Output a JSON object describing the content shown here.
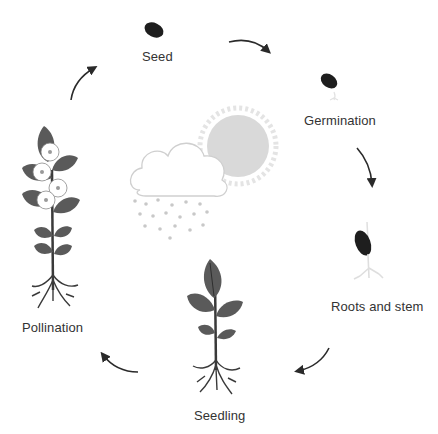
{
  "diagram": {
    "stages": [
      {
        "id": "seed",
        "label": "Seed"
      },
      {
        "id": "germination",
        "label": "Germination"
      },
      {
        "id": "roots-and-stem",
        "label": "Roots and stem"
      },
      {
        "id": "seedling",
        "label": "Seedling"
      },
      {
        "id": "pollination",
        "label": "Pollination"
      }
    ],
    "center": {
      "elements": [
        "cloud",
        "rain",
        "sun"
      ]
    },
    "arrows": [
      {
        "from": "Seed",
        "to": "Germination"
      },
      {
        "from": "Germination",
        "to": "Roots and stem"
      },
      {
        "from": "Roots and stem",
        "to": "Seedling"
      },
      {
        "from": "Seedling",
        "to": "Pollination"
      },
      {
        "from": "Pollination",
        "to": "Seed"
      }
    ],
    "colors": {
      "seed": "#1e1e1e",
      "leaf": "#5a5a5a",
      "leaf_vein": "#2e2e2e",
      "stem": "#3a3a3a",
      "arrow": "#2a2a2a",
      "sun": "#d9d9d9",
      "cloud_outline": "#cfcfcf",
      "rain": "#c8c8c8",
      "text": "#333333"
    }
  }
}
